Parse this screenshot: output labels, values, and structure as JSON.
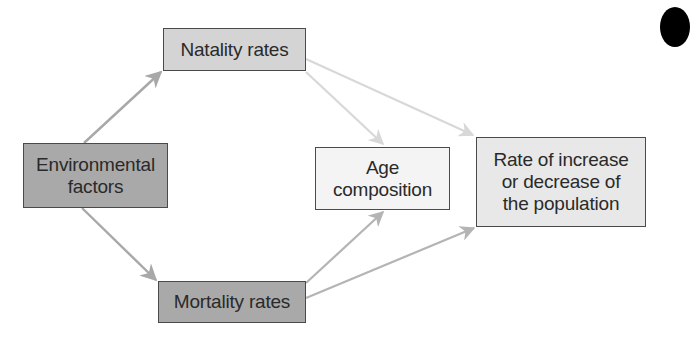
{
  "diagram": {
    "type": "flow",
    "nodes": [
      {
        "id": "natality",
        "label": "Natality rates",
        "lines": [
          "Natality rates"
        ],
        "fill": "#d4d4d4"
      },
      {
        "id": "environmental",
        "label": "Environmental factors",
        "lines": [
          "Environmental",
          "factors"
        ],
        "fill": "#a9a9a9"
      },
      {
        "id": "mortality",
        "label": "Mortality rates",
        "lines": [
          "Mortality rates"
        ],
        "fill": "#a9a9a9"
      },
      {
        "id": "age",
        "label": "Age composition",
        "lines": [
          "Age",
          "composition"
        ],
        "fill": "#f4f4f4"
      },
      {
        "id": "rate",
        "label": "Rate of increase or decrease of the population",
        "lines": [
          "Rate of increase",
          "or decrease of",
          "the population"
        ],
        "fill": "#e8e8e8"
      }
    ],
    "edges": [
      {
        "from": "environmental",
        "to": "natality",
        "color": "#a8a8a8"
      },
      {
        "from": "environmental",
        "to": "mortality",
        "color": "#a8a8a8"
      },
      {
        "from": "natality",
        "to": "age",
        "color": "#d8d8d8"
      },
      {
        "from": "natality",
        "to": "rate",
        "color": "#d8d8d8"
      },
      {
        "from": "mortality",
        "to": "age",
        "color": "#b4b4b4"
      },
      {
        "from": "mortality",
        "to": "rate",
        "color": "#b4b4b4"
      }
    ],
    "colors": {
      "border": "#4a4a4a",
      "text": "#2a2a2a",
      "corner_mark": "#000000"
    }
  }
}
